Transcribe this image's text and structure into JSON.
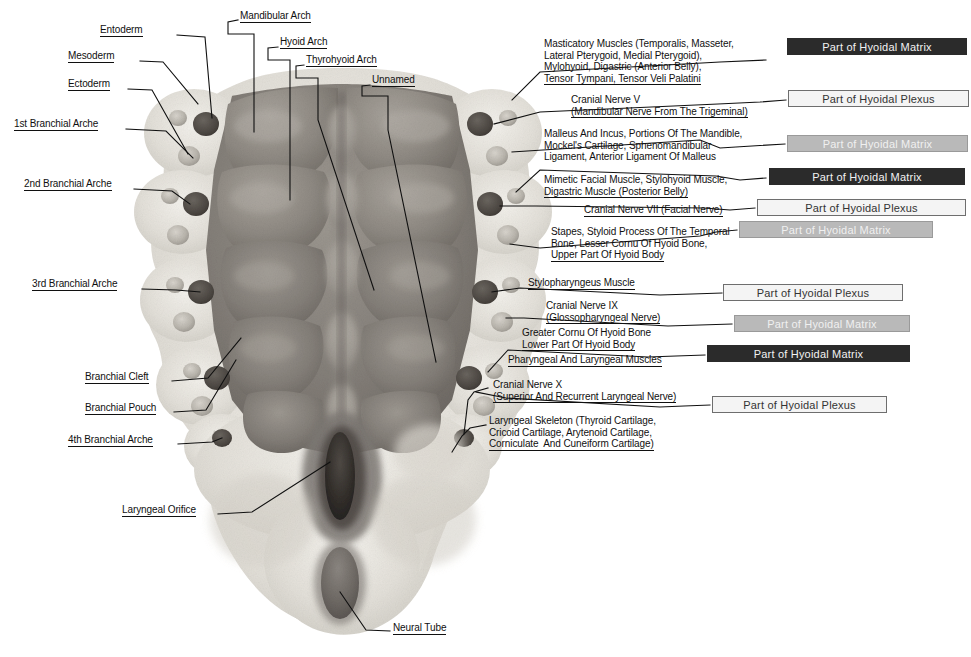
{
  "figure": {
    "background": "#ffffff",
    "width": 971,
    "height": 657
  },
  "palette": {
    "line": "#101010",
    "badge_dark_bg": "#2b2b2b",
    "badge_dark_text": "#f2f2f2",
    "badge_light_bg": "#f4f4f4",
    "badge_light_text": "#333333",
    "badge_mid_bg": "#b9b9b9",
    "badge_mid_text": "#f0f0f0",
    "tissue_light": "#e9e6e0",
    "tissue_mid": "#9a958f",
    "tissue_dark": "#6d6862",
    "pit_dark": "#4a4540"
  },
  "left_labels": [
    {
      "id": "entoderm",
      "text": "Entoderm",
      "x": 100,
      "y": 24,
      "align": "left",
      "underline": true
    },
    {
      "id": "mesoderm",
      "text": "Mesoderm",
      "x": 68,
      "y": 50,
      "align": "left",
      "underline": true
    },
    {
      "id": "ectoderm",
      "text": "Ectoderm",
      "x": 68,
      "y": 78,
      "align": "left",
      "underline": true
    },
    {
      "id": "arch-1",
      "text": "1st Branchial Arche",
      "x": 14,
      "y": 118,
      "align": "left",
      "underline": true
    },
    {
      "id": "arch-2",
      "text": "2nd Branchial Arche",
      "x": 24,
      "y": 178,
      "align": "left",
      "underline": true
    },
    {
      "id": "arch-3",
      "text": "3rd Branchial Arche",
      "x": 32,
      "y": 278,
      "align": "left",
      "underline": true
    },
    {
      "id": "branchial-cleft",
      "text": "Branchial Cleft",
      "x": 85,
      "y": 371,
      "align": "left",
      "underline": true
    },
    {
      "id": "branchial-pouch",
      "text": "Branchial Pouch",
      "x": 85,
      "y": 402,
      "align": "left",
      "underline": true
    },
    {
      "id": "arch-4",
      "text": "4th Branchial Arche",
      "x": 68,
      "y": 434,
      "align": "left",
      "underline": true
    },
    {
      "id": "laryngeal-orifice",
      "text": "Laryngeal Orifice",
      "x": 122,
      "y": 504,
      "align": "left",
      "underline": true
    },
    {
      "id": "neural-tube",
      "text": "Neural Tube",
      "x": 393,
      "y": 622,
      "align": "left",
      "underline": true
    }
  ],
  "top_labels": [
    {
      "id": "mandibular-arch",
      "text": "Mandibular Arch",
      "x": 240,
      "y": 10,
      "underline": true
    },
    {
      "id": "hyoid-arch",
      "text": "Hyoid Arch",
      "x": 280,
      "y": 36,
      "underline": true
    },
    {
      "id": "thyrohyoid-arch",
      "text": "Thyrohyoid Arch",
      "x": 306,
      "y": 54,
      "underline": true
    },
    {
      "id": "unnamed-arch",
      "text": "Unnamed",
      "x": 372,
      "y": 74,
      "underline": true
    }
  ],
  "right_labels": [
    {
      "id": "masticatory-muscles",
      "x": 544,
      "y": 38,
      "lines": [
        "Masticatory Muscles (Temporalis, Masseter,",
        "Lateral Pterygoid, Medial Pterygoid),",
        "Mylohyoid, Digastric (Anterior Belly),",
        "Tensor Tympani, Tensor Veli Palatini"
      ],
      "underline": true
    },
    {
      "id": "cranial-nerve-v",
      "x": 571,
      "y": 94,
      "lines": [
        "Cranial Nerve V",
        "(Mandibular Nerve From The Trigeminal)"
      ],
      "underline": true
    },
    {
      "id": "malleus-incus",
      "x": 544,
      "y": 128,
      "lines": [
        "Malleus And Incus, Portions Of The Mandible,",
        "Mockel's Cartilage, Sphenomandibular",
        "Ligament, Anterior Ligament Of Malleus"
      ],
      "underline": false
    },
    {
      "id": "mimetic-facial-muscle",
      "x": 544,
      "y": 174,
      "lines": [
        "Mimetic Facial Muscle, Stylohyoid Muscle,",
        "Digastric Muscle (Posterior Belly)"
      ],
      "underline": true
    },
    {
      "id": "cranial-nerve-vii",
      "x": 584,
      "y": 204,
      "lines": [
        "Cranial Nerve VII (Facial Nerve)"
      ],
      "underline": true
    },
    {
      "id": "stapes-styloid",
      "x": 551,
      "y": 226,
      "lines": [
        "Stapes, Styloid Process Of The Temporal",
        "Bone, Lesser Cornu Of Hyoid Bone,",
        "Upper Part Of Hyoid Body"
      ],
      "underline": true
    },
    {
      "id": "stylopharyngeus-muscle",
      "x": 528,
      "y": 277,
      "lines": [
        "Stylopharyngeus Muscle"
      ],
      "underline": true
    },
    {
      "id": "cranial-nerve-ix",
      "x": 546,
      "y": 300,
      "lines": [
        "Cranial Nerve IX",
        "(Glossopharyngeal Nerve)"
      ],
      "underline": true
    },
    {
      "id": "greater-cornu",
      "x": 522,
      "y": 327,
      "lines": [
        "Greater Cornu Of Hyoid Bone",
        "Lower Part Of Hyoid Body"
      ],
      "underline": true
    },
    {
      "id": "pharyngeal-laryngeal-muscles",
      "x": 508,
      "y": 354,
      "lines": [
        "Pharyngeal And Laryngeal Muscles"
      ],
      "underline": true
    },
    {
      "id": "cranial-nerve-x",
      "x": 493,
      "y": 379,
      "lines": [
        "Cranial Nerve X",
        "(Superior And Recurrent Laryngeal Nerve)"
      ],
      "underline": true
    },
    {
      "id": "laryngeal-skeleton",
      "x": 489,
      "y": 415,
      "lines": [
        "Laryngeal Skeleton (Thyroid Cartilage,",
        "Cricoid Cartilage, Arytenoid Cartilage,",
        "Corniculate  And Cuneiform Cartilage)"
      ],
      "underline": true
    }
  ],
  "badges": [
    {
      "id": "badge-1",
      "text": "Part of Hyoidal Matrix",
      "style": "dark",
      "x": 787,
      "y": 38,
      "w": 180
    },
    {
      "id": "badge-2",
      "text": "Part of Hyoidal Plexus",
      "style": "light",
      "x": 788,
      "y": 90,
      "w": 181
    },
    {
      "id": "badge-3",
      "text": "Part of Hyoidal Matrix",
      "style": "mid",
      "x": 787,
      "y": 135,
      "w": 181
    },
    {
      "id": "badge-4",
      "text": "Part of Hyoidal Matrix",
      "style": "dark",
      "x": 769,
      "y": 168,
      "w": 196
    },
    {
      "id": "badge-5",
      "text": "Part of Hyoidal Plexus",
      "style": "light",
      "x": 757,
      "y": 199,
      "w": 209
    },
    {
      "id": "badge-6",
      "text": "Part of Hyoidal Matrix",
      "style": "mid",
      "x": 739,
      "y": 221,
      "w": 194
    },
    {
      "id": "badge-7",
      "text": "Part of Hyoidal Plexus",
      "style": "light",
      "x": 723,
      "y": 284,
      "w": 180
    },
    {
      "id": "badge-8",
      "text": "Part of Hyoidal Matrix",
      "style": "mid",
      "x": 734,
      "y": 315,
      "w": 176
    },
    {
      "id": "badge-9",
      "text": "Part of Hyoidal Matrix",
      "style": "dark",
      "x": 707,
      "y": 345,
      "w": 203
    },
    {
      "id": "badge-10",
      "text": "Part of Hyoidal Plexus",
      "style": "light",
      "x": 712,
      "y": 396,
      "w": 175
    }
  ]
}
